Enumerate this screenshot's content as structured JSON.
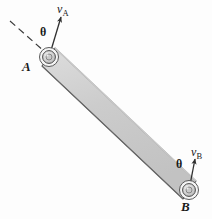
{
  "figure": {
    "bar": {
      "fill_color": "#cfcfcf",
      "stroke_color": "#4a4a4a",
      "top_face_color": "#e2e2e2"
    },
    "pins": [
      {
        "name": "pin-A",
        "label": "A",
        "cx": 49,
        "cy": 57
      },
      {
        "name": "pin-B",
        "label": "B",
        "cx": 189,
        "cy": 190
      }
    ],
    "velocity_vectors": [
      {
        "name": "velocity-A",
        "label": "v",
        "subscript": "A",
        "tail": {
          "x": 49,
          "y": 57
        },
        "tip": {
          "x": 61,
          "y": 16
        }
      },
      {
        "name": "velocity-B",
        "label": "v",
        "subscript": "B",
        "tail": {
          "x": 189,
          "y": 190
        },
        "tip": {
          "x": 195,
          "y": 158
        }
      }
    ],
    "angles": [
      {
        "name": "angle-theta-A",
        "symbol": "θ"
      },
      {
        "name": "angle-theta-B",
        "symbol": "θ"
      }
    ],
    "reference_line": {
      "name": "dashed-reference-line-A",
      "style": "dashed",
      "from": {
        "x": 10,
        "y": 21
      },
      "to": {
        "x": 45,
        "y": 52
      }
    },
    "colors": {
      "ink": "#1a1a1a",
      "line": "#404040",
      "bar_fill": "#cfcfcf",
      "background": "#fdfdfd"
    }
  }
}
